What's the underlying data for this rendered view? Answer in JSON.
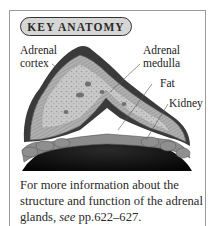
{
  "badge": {
    "label": "KEY ANATOMY"
  },
  "labels": {
    "adrenal_cortex": [
      "Adrenal",
      "cortex"
    ],
    "adrenal_medulla": [
      "Adrenal",
      "medulla"
    ],
    "fat": "Fat",
    "kidney": "Kidney"
  },
  "caption": {
    "text_before": "For more information about the structure and function of the adrenal glands, ",
    "see": "see",
    "ref": " pp.622–627."
  },
  "colors": {
    "kidney": "#111111",
    "cortex_outer": "#3a3a3a",
    "cortex_band": "#a8a8a8",
    "medulla": "#c4c4c4",
    "fat": "#8c8c8c",
    "frame_border": "#9a9a9a",
    "badge_fill": "#d6d6d6"
  }
}
